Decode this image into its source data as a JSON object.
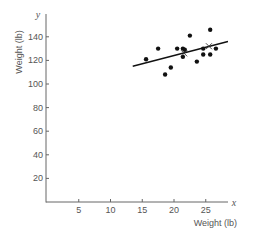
{
  "chart_data": {
    "type": "scatter",
    "title": "",
    "xlabel": "Weight (lb)",
    "ylabel": "Weight (lb)",
    "x_axis_var": "x",
    "y_axis_var": "y",
    "xlim": [
      0,
      28.5
    ],
    "ylim": [
      0,
      160
    ],
    "x_ticks": [
      5,
      10,
      15,
      20,
      25
    ],
    "y_ticks": [
      20,
      40,
      60,
      80,
      100,
      120,
      140
    ],
    "grid": false,
    "legend": null,
    "series": [
      {
        "name": "observations",
        "marker": "filled-circle",
        "color": "#111111",
        "points": [
          {
            "x": 15.6,
            "y": 121
          },
          {
            "x": 17.5,
            "y": 130
          },
          {
            "x": 18.6,
            "y": 108
          },
          {
            "x": 19.5,
            "y": 114
          },
          {
            "x": 20.5,
            "y": 130
          },
          {
            "x": 21.4,
            "y": 130
          },
          {
            "x": 21.7,
            "y": 129
          },
          {
            "x": 21.4,
            "y": 123
          },
          {
            "x": 22.5,
            "y": 141
          },
          {
            "x": 23.6,
            "y": 119
          },
          {
            "x": 24.6,
            "y": 130
          },
          {
            "x": 24.6,
            "y": 125
          },
          {
            "x": 25.7,
            "y": 146
          },
          {
            "x": 25.7,
            "y": 125
          },
          {
            "x": 26.6,
            "y": 130
          }
        ]
      },
      {
        "name": "highlighted points",
        "marker": "x",
        "color": "#333333",
        "points": [
          {
            "x": 21.6,
            "y": 126
          },
          {
            "x": 25.5,
            "y": 132
          }
        ]
      },
      {
        "name": "regression line",
        "type": "line",
        "color": "#111111",
        "points": [
          {
            "x": 13.5,
            "y": 115
          },
          {
            "x": 28.5,
            "y": 136
          }
        ]
      }
    ]
  }
}
